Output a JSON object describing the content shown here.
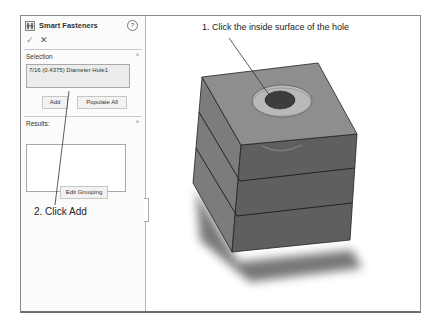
{
  "panel": {
    "title": "Smart Fasteners",
    "icons": {
      "feature": "smart-fastener-icon",
      "help": "help-icon",
      "ok": "check-icon",
      "cancel": "close-icon"
    },
    "help_glyph": "?",
    "ok_glyph": "✓",
    "cancel_glyph": "✕",
    "selection": {
      "label": "Selection",
      "chevron": "^",
      "value": "7/16 (0.4375) Diameter Hole1",
      "add_button": "Add",
      "populate_button": "Populate All"
    },
    "results": {
      "label": "Results:",
      "chevron": "^",
      "edit_grouping_button": "Edit Grouping"
    }
  },
  "callouts": {
    "step1": "1. Click the inside surface of the hole",
    "step2": "2. Click Add"
  },
  "colors": {
    "top_face": "#8c8c8c",
    "left_face": "#7a7a7a",
    "front_face": "#5e5e5e",
    "ring": "#bdbdbd",
    "hole": "#3e3e3e"
  }
}
